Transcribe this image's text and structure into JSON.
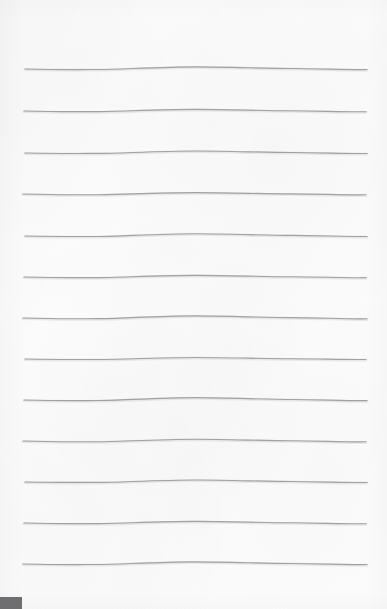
{
  "document": {
    "kind": "scanned-ruled-notebook-paper",
    "width": 387,
    "height": 609,
    "background_color": "#fcfcfc",
    "page_color": "#fcfcfc",
    "content_text": "",
    "is_blank": true
  },
  "ruled_lines": {
    "count": 13,
    "color": "#9a9a9e",
    "highlight_color": "#d9d9dd",
    "stroke_width": 1.15,
    "x_start": 23,
    "x_end": 367,
    "first_line_y": 69,
    "spacing": 41.2,
    "lines": [
      {
        "index": 1,
        "y": 69,
        "x_start": 25,
        "x_end": 367,
        "bow": -2.2,
        "dip": 1.1
      },
      {
        "index": 2,
        "y": 111,
        "x_start": 24,
        "x_end": 366,
        "bow": -1.6,
        "dip": 1.4
      },
      {
        "index": 3,
        "y": 153,
        "x_start": 25,
        "x_end": 367,
        "bow": -2.0,
        "dip": 0.9
      },
      {
        "index": 4,
        "y": 194,
        "x_start": 23,
        "x_end": 366,
        "bow": -1.4,
        "dip": 1.6
      },
      {
        "index": 5,
        "y": 236,
        "x_start": 25,
        "x_end": 367,
        "bow": -2.3,
        "dip": 1.0
      },
      {
        "index": 6,
        "y": 277,
        "x_start": 24,
        "x_end": 366,
        "bow": -1.7,
        "dip": 1.3
      },
      {
        "index": 7,
        "y": 318,
        "x_start": 23,
        "x_end": 367,
        "bow": -2.1,
        "dip": 1.5
      },
      {
        "index": 8,
        "y": 359,
        "x_start": 25,
        "x_end": 366,
        "bow": -1.5,
        "dip": 1.0
      },
      {
        "index": 9,
        "y": 400,
        "x_start": 24,
        "x_end": 367,
        "bow": -2.4,
        "dip": 1.2
      },
      {
        "index": 10,
        "y": 441,
        "x_start": 23,
        "x_end": 366,
        "bow": -1.8,
        "dip": 1.6
      },
      {
        "index": 11,
        "y": 482,
        "x_start": 25,
        "x_end": 367,
        "bow": -2.0,
        "dip": 0.9
      },
      {
        "index": 12,
        "y": 523,
        "x_start": 24,
        "x_end": 366,
        "bow": -1.6,
        "dip": 1.4
      },
      {
        "index": 13,
        "y": 564,
        "x_start": 23,
        "x_end": 367,
        "bow": -2.2,
        "dip": 1.1
      }
    ]
  },
  "artifacts": {
    "corner_mark": {
      "label": "bottom-left scan edge artifact",
      "color": "#6e6e70",
      "x": 0,
      "y": 597,
      "width": 22,
      "height": 12
    }
  }
}
